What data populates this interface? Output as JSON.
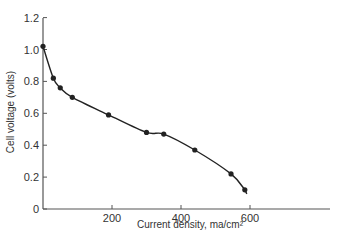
{
  "chart_data": {
    "type": "line",
    "title": "",
    "xlabel": "Current density, ma/cm²",
    "ylabel": "Cell voltage (volts)",
    "xlim": [
      0,
      850
    ],
    "ylim": [
      0,
      1.2
    ],
    "x_ticks": [
      200,
      400,
      600
    ],
    "x_tick_labels": [
      "200",
      "400",
      "600"
    ],
    "y_ticks": [
      0,
      0.2,
      0.4,
      0.6,
      0.8,
      1.0,
      1.2
    ],
    "y_tick_labels": [
      "0",
      "0.2",
      "0.4",
      "0.6",
      "0.8",
      "1.0",
      "1.2"
    ],
    "grid": false,
    "legend": null,
    "series": [
      {
        "name": "Cell voltage",
        "markers": true,
        "smooth_curve": true,
        "x": [
          0,
          30,
          50,
          85,
          190,
          300,
          350,
          440,
          545,
          585
        ],
        "y": [
          1.02,
          0.82,
          0.76,
          0.7,
          0.59,
          0.48,
          0.47,
          0.37,
          0.22,
          0.12
        ]
      }
    ]
  }
}
